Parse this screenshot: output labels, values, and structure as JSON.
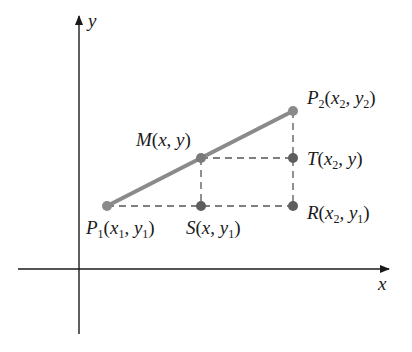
{
  "diagram": {
    "axes": {
      "x_label": "x",
      "y_label": "y"
    },
    "colors": {
      "segment": "#8a8a8a",
      "point": "#5e5e5e",
      "dashed": "#555555",
      "axis": "#1a1a1a"
    },
    "points": [
      {
        "id": "P1",
        "name": "P",
        "sub": "1",
        "coords": "(x1, y1)",
        "px": [
          107,
          206
        ]
      },
      {
        "id": "M",
        "name": "M",
        "coords": "(x, y)",
        "px": [
          201,
          158
        ]
      },
      {
        "id": "P2",
        "name": "P",
        "sub": "2",
        "coords": "(x2, y2)",
        "px": [
          293,
          111
        ]
      },
      {
        "id": "T",
        "name": "T",
        "coords": "(x2, y)",
        "px": [
          293,
          158
        ]
      },
      {
        "id": "R",
        "name": "R",
        "coords": "(x2, y1)",
        "px": [
          293,
          206
        ]
      },
      {
        "id": "S",
        "name": "S",
        "coords": "(x, y1)",
        "px": [
          201,
          206
        ]
      }
    ],
    "labels": {
      "P1": "P1(x1, y1)",
      "M": "M(x, y)",
      "P2": "P2(x2, y2)",
      "T": "T(x2, y)",
      "R": "R(x2, y1)",
      "S": "S(x, y1)"
    }
  }
}
